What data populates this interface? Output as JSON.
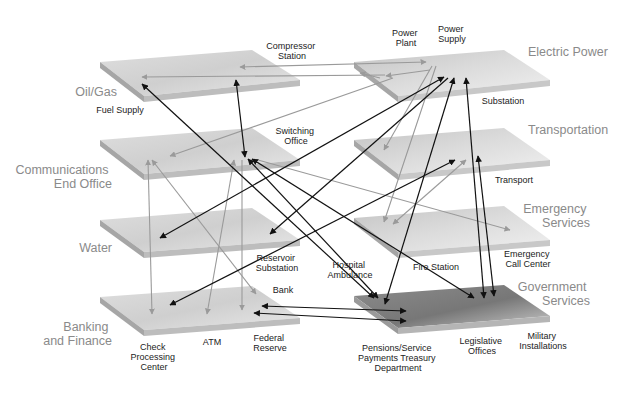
{
  "diagram": {
    "colors": {
      "plane_top_light": "#e6e6e6",
      "plane_top_dark": "#bdbdbd",
      "plane_side": "#a8a8a8",
      "plane_gov_dark": "#8a8a8a",
      "arrow_black": "#111111",
      "arrow_gray": "#9a9a9a",
      "sector_label": "#8a8a8a",
      "node_label": "#222222"
    },
    "sectors": [
      {
        "id": "oil_gas",
        "label_lines": [
          "Oil/Gas"
        ]
      },
      {
        "id": "communications",
        "label_lines": [
          "Communications",
          "End Office"
        ]
      },
      {
        "id": "water",
        "label_lines": [
          "Water"
        ]
      },
      {
        "id": "banking",
        "label_lines": [
          "Banking",
          "and Finance"
        ]
      },
      {
        "id": "electric",
        "label_lines": [
          "Electric Power"
        ]
      },
      {
        "id": "transportation",
        "label_lines": [
          "Transportation"
        ]
      },
      {
        "id": "emergency",
        "label_lines": [
          "Emergency",
          "Services"
        ]
      },
      {
        "id": "government",
        "label_lines": [
          "Government",
          "Services"
        ]
      }
    ],
    "nodes": [
      {
        "id": "compressor_station",
        "label_lines": [
          "Compressor",
          "Station"
        ]
      },
      {
        "id": "fuel_supply",
        "label_lines": [
          "Fuel Supply"
        ]
      },
      {
        "id": "power_plant",
        "label_lines": [
          "Power",
          "Plant"
        ]
      },
      {
        "id": "power_supply",
        "label_lines": [
          "Power",
          "Supply"
        ]
      },
      {
        "id": "substation",
        "label_lines": [
          "Substation"
        ]
      },
      {
        "id": "switching_office",
        "label_lines": [
          "Switching",
          "Office"
        ]
      },
      {
        "id": "transport",
        "label_lines": [
          "Transport"
        ]
      },
      {
        "id": "reservoir_substation",
        "label_lines": [
          "Reservoir",
          "Substation"
        ]
      },
      {
        "id": "hospital_ambulance",
        "label_lines": [
          "Hospital",
          "Ambulance"
        ]
      },
      {
        "id": "fire_station",
        "label_lines": [
          "Fire Station"
        ]
      },
      {
        "id": "emergency_call_center",
        "label_lines": [
          "Emergency",
          "Call Center"
        ]
      },
      {
        "id": "bank",
        "label_lines": [
          "Bank"
        ]
      },
      {
        "id": "check_processing_center",
        "label_lines": [
          "Check",
          "Processing",
          "Center"
        ]
      },
      {
        "id": "atm",
        "label_lines": [
          "ATM"
        ]
      },
      {
        "id": "federal_reserve",
        "label_lines": [
          "Federal",
          "Reserve"
        ]
      },
      {
        "id": "pensions",
        "label_lines": [
          "Pensions/Service",
          "Payments Treasury",
          "Department"
        ]
      },
      {
        "id": "legislative_offices",
        "label_lines": [
          "Legislative",
          "Offices"
        ]
      },
      {
        "id": "military_installations",
        "label_lines": [
          "Military",
          "Installations"
        ]
      }
    ]
  }
}
